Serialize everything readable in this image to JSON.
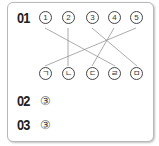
{
  "q1": {
    "label": "01",
    "top": [
      "1",
      "2",
      "3",
      "4",
      "5"
    ],
    "bottom": [
      "ㄱ",
      "ㄴ",
      "ㄷ",
      "ㄹ",
      "ㅁ"
    ],
    "connections": [
      [
        0,
        3
      ],
      [
        1,
        1
      ],
      [
        2,
        4
      ],
      [
        3,
        2
      ],
      [
        4,
        0
      ]
    ]
  },
  "q2": {
    "label": "02",
    "answer": "③"
  },
  "q3": {
    "label": "03",
    "answer": "③"
  },
  "colors": {
    "line": "#888888",
    "border": "#b8b8b8"
  }
}
